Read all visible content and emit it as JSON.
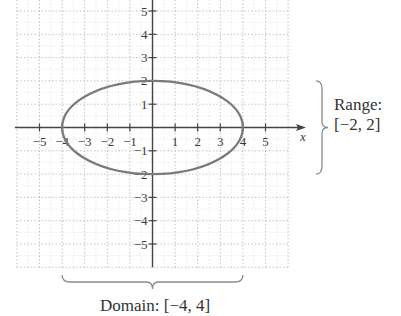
{
  "chart_data": {
    "type": "line",
    "title": "",
    "curve": "ellipse",
    "equation_implied": "x^2/16 + y^2/4 = 1",
    "center": [
      0,
      0
    ],
    "semi_axis_x": 4,
    "semi_axis_y": 2,
    "xlabel": "x",
    "ylabel": "",
    "x_ticks": [
      -5,
      -4,
      -3,
      -2,
      -1,
      1,
      2,
      3,
      4,
      5
    ],
    "x_tick_labels": [
      "−5",
      "−4",
      "−3",
      "−2",
      "−1",
      "1",
      "2",
      "3",
      "4",
      "5"
    ],
    "y_ticks": [
      5,
      4,
      3,
      2,
      1,
      -1,
      -2,
      -3,
      -4,
      -5
    ],
    "y_tick_labels": [
      "5",
      "4",
      "3",
      "2",
      "1",
      "−1",
      "−2",
      "−3",
      "−4",
      "−5"
    ],
    "xlim": [
      -6,
      6.5
    ],
    "ylim": [
      -6,
      5.5
    ],
    "grid": true,
    "grid_style": "dotted",
    "annotations": [
      {
        "text_line1": "Range:",
        "text_line2": "[−2, 2]",
        "kind": "brace-vertical",
        "span_y": [
          -2,
          2
        ]
      },
      {
        "text": "Domain: [−4, 4]",
        "kind": "brace-horizontal",
        "span_x": [
          -4,
          4
        ]
      }
    ],
    "colors": {
      "curve": "#7a7a7a",
      "axis": "#444444",
      "grid": "#bdbdbd",
      "brace": "#8a8a8a"
    }
  },
  "annotations": {
    "range_line1": "Range:",
    "range_line2": "[−2, 2]",
    "domain": "Domain: [−4, 4]"
  }
}
